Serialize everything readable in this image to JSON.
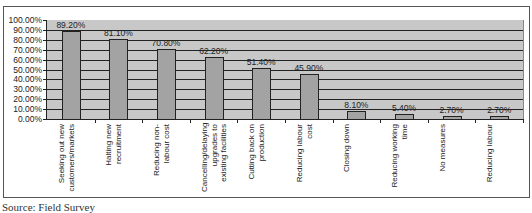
{
  "chart_data": {
    "type": "bar",
    "title": "",
    "xlabel": "",
    "ylabel": "",
    "categories": [
      "Seeking out new customers/markets",
      "Halting new recruitment",
      "Reducing non-labour cost",
      "Cancelling/delaying upgrades to existing facilities",
      "Cutting back on production",
      "Reducing labour cost",
      "Closing down",
      "Reducing working time",
      "No measures",
      "Reducing labour"
    ],
    "values": [
      89.2,
      81.1,
      70.8,
      62.2,
      51.4,
      45.9,
      8.1,
      5.4,
      2.7,
      2.7
    ],
    "value_labels": [
      "89.20%",
      "81.10%",
      "70.80%",
      "62.20%",
      "51.40%",
      "45.90%",
      "8.10%",
      "5.40%",
      "2.70%",
      "2.70%"
    ],
    "yticks": [
      "100.00%",
      "90.00%",
      "80.00%",
      "70.00%",
      "60.00%",
      "50.00%",
      "40.00%",
      "30.00%",
      "20.00%",
      "10.00%",
      "0.00%"
    ],
    "ylim": [
      0,
      100
    ],
    "grid": true,
    "legend": null,
    "colors": {
      "bar": "#a3a3a3",
      "plot_bg": "#c8c8c8",
      "grid": "#222222"
    }
  },
  "source_note": "Source: Field Survey"
}
